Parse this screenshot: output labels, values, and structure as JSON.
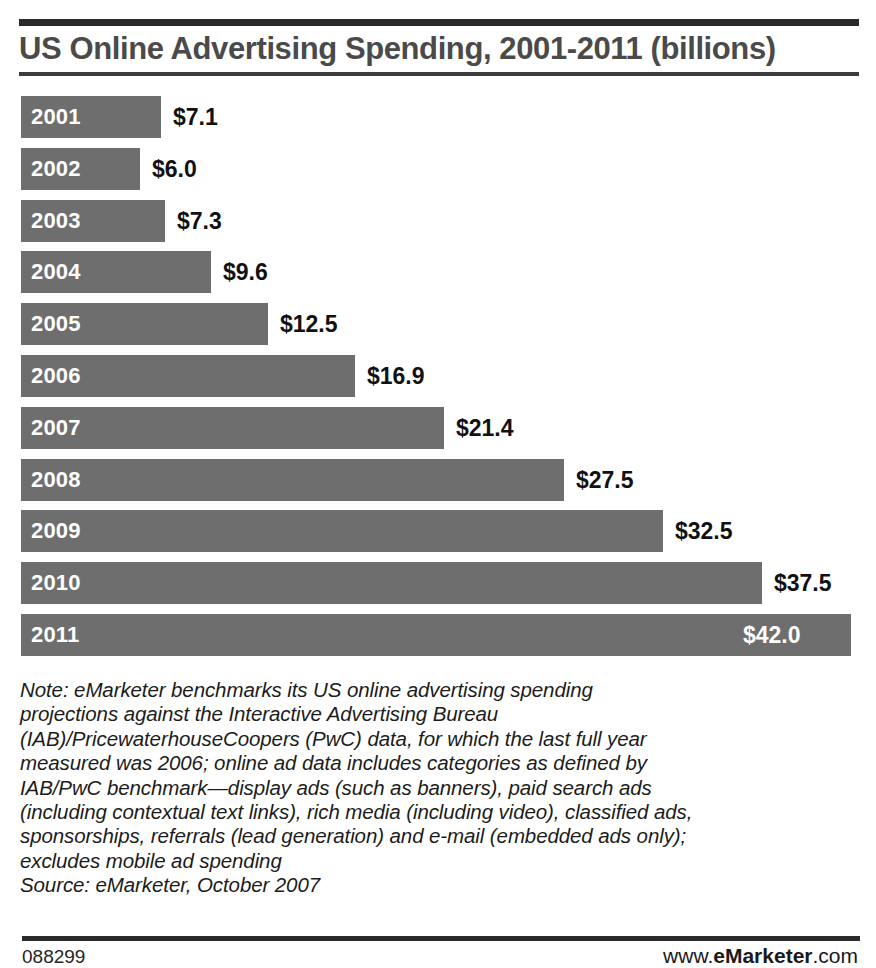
{
  "chart_data": {
    "type": "bar",
    "orientation": "horizontal",
    "title": "US Online Advertising Spending, 2001-2011 (billions)",
    "xlabel": "",
    "ylabel": "",
    "categories": [
      "2001",
      "2002",
      "2003",
      "2004",
      "2005",
      "2006",
      "2007",
      "2008",
      "2009",
      "2010",
      "2011"
    ],
    "values": [
      7.1,
      6.0,
      7.3,
      9.6,
      12.5,
      16.9,
      21.4,
      27.5,
      32.5,
      37.5,
      42.0
    ],
    "value_labels": [
      "$7.1",
      "$6.0",
      "$7.3",
      "$9.6",
      "$12.5",
      "$16.9",
      "$21.4",
      "$27.5",
      "$32.5",
      "$37.5",
      "$42.0"
    ],
    "label_placement": [
      "outside",
      "outside",
      "outside",
      "outside",
      "outside",
      "outside",
      "outside",
      "outside",
      "outside",
      "outside",
      "inside"
    ],
    "xlim": [
      0,
      42.5
    ],
    "grid": false,
    "legend": false,
    "bar_color": "#6e6e6e",
    "value_color": "#111111",
    "category_color": "#ffffff",
    "units": "billions of US dollars"
  },
  "note": {
    "lines": [
      "Note: eMarketer benchmarks its US online advertising spending",
      "projections against the Interactive Advertising Bureau",
      "(IAB)/PricewaterhouseCoopers (PwC) data, for which the last full year",
      "measured was 2006; online ad data includes categories as defined by",
      "IAB/PwC benchmark—display ads (such as banners), paid search ads",
      "(including contextual text links), rich media (including video), classified ads,",
      "sponsorships, referrals (lead generation) and e-mail (embedded ads only);",
      "excludes mobile ad spending",
      "Source: eMarketer, October 2007"
    ]
  },
  "footer": {
    "code": "088299",
    "brand_prefix": "www.",
    "brand_name": "eMarketer",
    "brand_suffix": ".com"
  }
}
